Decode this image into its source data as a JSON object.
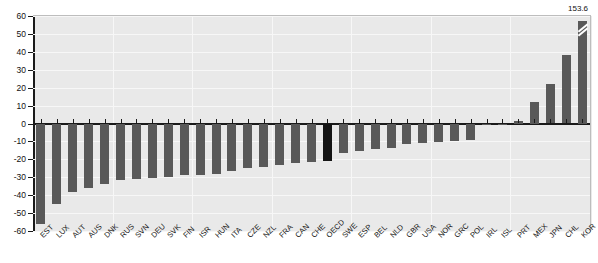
{
  "chart_data": {
    "type": "bar",
    "title": "",
    "subtitle": "",
    "xlabel": "",
    "ylabel": "",
    "ylim": [
      -60,
      60
    ],
    "grid": true,
    "legend": "none",
    "y_ticks": [
      60,
      50,
      40,
      30,
      20,
      10,
      0,
      -10,
      -20,
      -30,
      -40,
      -50,
      -60
    ],
    "categories": [
      "EST",
      "LUX",
      "AUT",
      "AUS",
      "DNK",
      "RUS",
      "SVN",
      "DEU",
      "SVK",
      "FIN",
      "ISR",
      "HUN",
      "ITA",
      "CZE",
      "NZL",
      "FRA",
      "CAN",
      "CHE",
      "OECD",
      "SWE",
      "ESP",
      "BEL",
      "NLD",
      "GBR",
      "USA",
      "NOR",
      "GRC",
      "POL",
      "IRL",
      "ISL",
      "PRT",
      "MEX",
      "JPN",
      "CHL",
      "KOR"
    ],
    "values": [
      -56.0,
      -45.0,
      -38.0,
      -36.0,
      -33.5,
      -31.5,
      -31.0,
      -30.5,
      -30.0,
      -29.0,
      -28.5,
      -28.0,
      -26.5,
      -25.0,
      -24.0,
      -23.0,
      -22.0,
      -21.5,
      -21.0,
      -16.5,
      -15.5,
      -14.5,
      -13.5,
      -11.5,
      -11.0,
      -10.5,
      -10.0,
      -9.0,
      -1.0,
      -0.5,
      1.5,
      12.0,
      22.0,
      38.5,
      57.0
    ],
    "highlight_category": "OECD",
    "highlight_color": "#151515",
    "bar_color": "#595959",
    "annotations": [
      {
        "category": "KOR",
        "label": "153.6",
        "note": "axis-break: bar truncated"
      }
    ],
    "axis_break": {
      "category": "KOR",
      "actual_value": 153.6
    }
  }
}
